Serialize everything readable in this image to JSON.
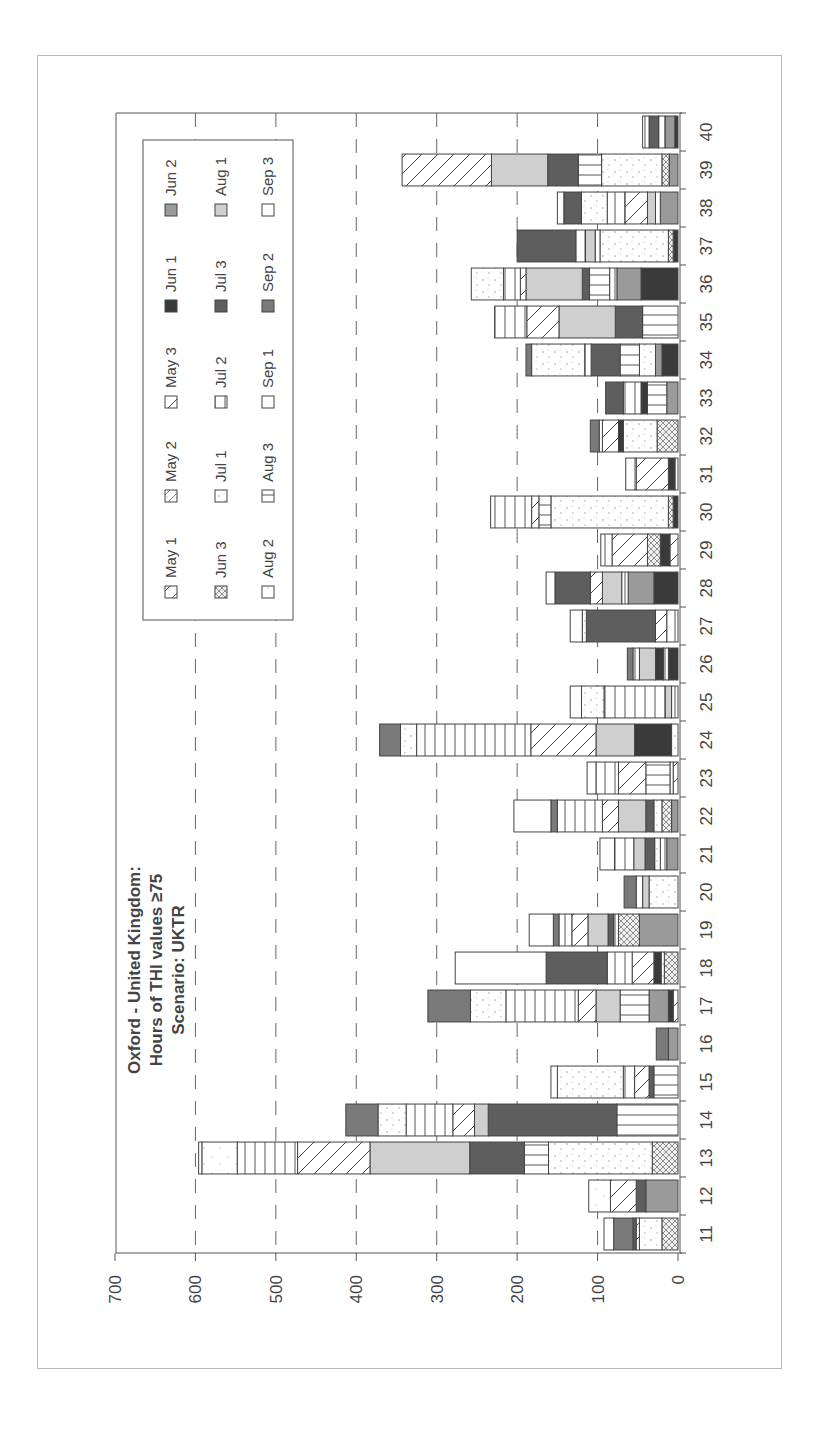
{
  "chart_data": {
    "type": "bar",
    "stacked": true,
    "orientation": "rotated-90",
    "title": "Oxford - United Kingdom:",
    "subtitle": "Hours of THI values ≥ 75",
    "scenario": "Scenario: UKTR",
    "title_lines": [
      "Oxford - United Kingdom:",
      "Hours of THI values ≥75",
      "Scenario: UKTR"
    ],
    "xlabel": "",
    "ylabel": "",
    "ylim": [
      0,
      700
    ],
    "yticks": [
      "0",
      "100",
      "200",
      "300",
      "400",
      "500",
      "600",
      "700"
    ],
    "grid": "dashed-major",
    "legend_position": "inside-top",
    "categories": [
      "11",
      "12",
      "13",
      "14",
      "15",
      "16",
      "17",
      "18",
      "19",
      "20",
      "21",
      "22",
      "23",
      "24",
      "25",
      "26",
      "27",
      "28",
      "29",
      "30",
      "31",
      "32",
      "33",
      "34",
      "35",
      "36",
      "37",
      "38",
      "39",
      "40"
    ],
    "legend": [
      {
        "key": "may1",
        "label": "May 1",
        "pattern": "diag-sparse"
      },
      {
        "key": "may2",
        "label": "May 2",
        "pattern": "diag-dot"
      },
      {
        "key": "may3",
        "label": "May 3",
        "pattern": "diag-dense"
      },
      {
        "key": "jun1",
        "label": "Jun 1",
        "pattern": "solid-darkest"
      },
      {
        "key": "jun2",
        "label": "Jun 2",
        "pattern": "solid-mid"
      },
      {
        "key": "jun3",
        "label": "Jun 3",
        "pattern": "crosshatch"
      },
      {
        "key": "jul1",
        "label": "Jul 1",
        "pattern": "dots"
      },
      {
        "key": "jul2",
        "label": "Jul 2",
        "pattern": "vertical"
      },
      {
        "key": "jul3",
        "label": "Jul 3",
        "pattern": "solid-dark"
      },
      {
        "key": "aug1",
        "label": "Aug 1",
        "pattern": "solid-light"
      },
      {
        "key": "aug2",
        "label": "Aug 2",
        "pattern": "dots-sparse"
      },
      {
        "key": "aug3",
        "label": "Aug 3",
        "pattern": "horizontal"
      },
      {
        "key": "sep1",
        "label": "Sep 1",
        "pattern": "white"
      },
      {
        "key": "sep2",
        "label": "Sep 2",
        "pattern": "solid-gray"
      },
      {
        "key": "sep3",
        "label": "Sep 3",
        "pattern": "white"
      }
    ],
    "totals": [
      92,
      111,
      596,
      413,
      158,
      27,
      311,
      277,
      185,
      67,
      97,
      204,
      113,
      371,
      134,
      63,
      134,
      164,
      96,
      233,
      65,
      109,
      90,
      189,
      228,
      257,
      200,
      150,
      343,
      44
    ],
    "bars": [
      {
        "week": "11",
        "segments": [
          [
            "jun3",
            20
          ],
          [
            "jul1",
            28
          ],
          [
            "may1",
            4
          ],
          [
            "jul3",
            4
          ],
          [
            "sep2",
            24
          ],
          [
            "sep3",
            12
          ]
        ]
      },
      {
        "week": "12",
        "segments": [
          [
            "jun2",
            40
          ],
          [
            "jul3",
            12
          ],
          [
            "may3",
            32
          ],
          [
            "aug2",
            27
          ]
        ]
      },
      {
        "week": "13",
        "segments": [
          [
            "jun3",
            32
          ],
          [
            "jul1",
            129
          ],
          [
            "aug3",
            30
          ],
          [
            "jul3",
            68
          ],
          [
            "aug1",
            124
          ],
          [
            "may3",
            90
          ],
          [
            "jul2",
            75
          ],
          [
            "aug2",
            44
          ],
          [
            "jul2",
            4
          ]
        ]
      },
      {
        "week": "14",
        "segments": [
          [
            "aug3",
            76
          ],
          [
            "jul3",
            160
          ],
          [
            "aug1",
            17
          ],
          [
            "may3",
            27
          ],
          [
            "jul2",
            58
          ],
          [
            "jul1",
            35
          ],
          [
            "sep2",
            40
          ]
        ]
      },
      {
        "week": "15",
        "segments": [
          [
            "aug3",
            30
          ],
          [
            "jul3",
            6
          ],
          [
            "may3",
            18
          ],
          [
            "jul2",
            14
          ],
          [
            "jul1",
            82
          ],
          [
            "sep3",
            8
          ]
        ]
      },
      {
        "week": "16",
        "segments": [
          [
            "jun2",
            12
          ],
          [
            "sep2",
            15
          ]
        ]
      },
      {
        "week": "17",
        "segments": [
          [
            "may3",
            6
          ],
          [
            "jun1",
            6
          ],
          [
            "jun2",
            24
          ],
          [
            "aug3",
            36
          ],
          [
            "aug1",
            30
          ],
          [
            "may3",
            22
          ],
          [
            "jul2",
            90
          ],
          [
            "jul1",
            44
          ],
          [
            "sep2",
            53
          ]
        ]
      },
      {
        "week": "18",
        "segments": [
          [
            "jun3",
            17
          ],
          [
            "jul1",
            4
          ],
          [
            "jun1",
            9
          ],
          [
            "may3",
            27
          ],
          [
            "jul2",
            31
          ],
          [
            "jul3",
            76
          ],
          [
            "sep3",
            113
          ]
        ]
      },
      {
        "week": "19",
        "segments": [
          [
            "jun2",
            48
          ],
          [
            "jun3",
            26
          ],
          [
            "jul2",
            6
          ],
          [
            "jul3",
            7
          ],
          [
            "aug1",
            25
          ],
          [
            "may3",
            20
          ],
          [
            "jul2",
            16
          ],
          [
            "sep2",
            7
          ],
          [
            "sep3",
            30
          ]
        ]
      },
      {
        "week": "20",
        "segments": [
          [
            "jul1",
            36
          ],
          [
            "aug1",
            8
          ],
          [
            "jul2",
            8
          ],
          [
            "sep2",
            15
          ]
        ]
      },
      {
        "week": "21",
        "segments": [
          [
            "jun2",
            14
          ],
          [
            "jul2",
            8
          ],
          [
            "jul1",
            7
          ],
          [
            "jul3",
            12
          ],
          [
            "aug1",
            14
          ],
          [
            "jul2",
            24
          ],
          [
            "sep3",
            18
          ]
        ]
      },
      {
        "week": "22",
        "segments": [
          [
            "jun2",
            8
          ],
          [
            "jun3",
            12
          ],
          [
            "jul1",
            10
          ],
          [
            "jul3",
            10
          ],
          [
            "aug1",
            34
          ],
          [
            "may3",
            20
          ],
          [
            "jul2",
            56
          ],
          [
            "sep2",
            8
          ],
          [
            "sep3",
            46
          ]
        ]
      },
      {
        "week": "23",
        "segments": [
          [
            "may3",
            6
          ],
          [
            "aug2",
            4
          ],
          [
            "aug3",
            30
          ],
          [
            "may3",
            34
          ],
          [
            "jul2",
            28
          ],
          [
            "sep3",
            11
          ]
        ]
      },
      {
        "week": "24",
        "segments": [
          [
            "jul1",
            8
          ],
          [
            "jun1",
            46
          ],
          [
            "aug1",
            48
          ],
          [
            "may3",
            81
          ],
          [
            "jul2",
            142
          ],
          [
            "jul1",
            20
          ],
          [
            "sep2",
            26
          ]
        ]
      },
      {
        "week": "25",
        "segments": [
          [
            "jul2",
            8
          ],
          [
            "aug1",
            8
          ],
          [
            "jul2",
            76
          ],
          [
            "jul1",
            28
          ],
          [
            "sep3",
            14
          ]
        ]
      },
      {
        "week": "26",
        "segments": [
          [
            "jun1",
            12
          ],
          [
            "jul2",
            6
          ],
          [
            "jun1",
            10
          ],
          [
            "aug1",
            20
          ],
          [
            "jul2",
            8
          ],
          [
            "sep2",
            7
          ]
        ]
      },
      {
        "week": "27",
        "segments": [
          [
            "jul2",
            14
          ],
          [
            "may3",
            14
          ],
          [
            "jul3",
            86
          ],
          [
            "jul1",
            5
          ],
          [
            "sep3",
            15
          ]
        ]
      },
      {
        "week": "28",
        "segments": [
          [
            "jun1",
            30
          ],
          [
            "jun2",
            32
          ],
          [
            "jul2",
            8
          ],
          [
            "aug1",
            24
          ],
          [
            "may3",
            15
          ],
          [
            "jul3",
            44
          ],
          [
            "sep3",
            11
          ]
        ]
      },
      {
        "week": "29",
        "segments": [
          [
            "may3",
            10
          ],
          [
            "jun1",
            12
          ],
          [
            "jun3",
            16
          ],
          [
            "may3",
            44
          ],
          [
            "jul2",
            14
          ]
        ]
      },
      {
        "week": "30",
        "segments": [
          [
            "jun1",
            6
          ],
          [
            "jun3",
            6
          ],
          [
            "jul1",
            146
          ],
          [
            "aug3",
            15
          ],
          [
            "may3",
            9
          ],
          [
            "jul2",
            51
          ]
        ]
      },
      {
        "week": "31",
        "segments": [
          [
            "jul2",
            4
          ],
          [
            "jun1",
            8
          ],
          [
            "may3",
            40
          ],
          [
            "jul2",
            13
          ]
        ]
      },
      {
        "week": "32",
        "segments": [
          [
            "jun3",
            26
          ],
          [
            "jul1",
            42
          ],
          [
            "jun1",
            6
          ],
          [
            "may3",
            20
          ],
          [
            "jul2",
            4
          ],
          [
            "sep2",
            11
          ]
        ]
      },
      {
        "week": "33",
        "segments": [
          [
            "jun2",
            14
          ],
          [
            "aug3",
            24
          ],
          [
            "jun1",
            8
          ],
          [
            "jul2",
            22
          ],
          [
            "jul3",
            22
          ]
        ]
      },
      {
        "week": "34",
        "segments": [
          [
            "jun1",
            20
          ],
          [
            "jun2",
            8
          ],
          [
            "jul1",
            20
          ],
          [
            "aug3",
            24
          ],
          [
            "jul3",
            36
          ],
          [
            "jul2",
            8
          ],
          [
            "jul1",
            66
          ],
          [
            "sep2",
            7
          ]
        ]
      },
      {
        "week": "35",
        "segments": [
          [
            "aug3",
            44
          ],
          [
            "jul3",
            34
          ],
          [
            "aug1",
            70
          ],
          [
            "may3",
            40
          ],
          [
            "jul2",
            40
          ]
        ]
      },
      {
        "week": "36",
        "segments": [
          [
            "jun1",
            46
          ],
          [
            "jun2",
            30
          ],
          [
            "jul2",
            9
          ],
          [
            "aug3",
            25
          ],
          [
            "jul3",
            9
          ],
          [
            "aug1",
            70
          ],
          [
            "may3",
            7
          ],
          [
            "jul2",
            21
          ],
          [
            "jul1",
            40
          ]
        ]
      },
      {
        "week": "37",
        "segments": [
          [
            "jun1",
            6
          ],
          [
            "jun3",
            6
          ],
          [
            "jul1",
            85
          ],
          [
            "jul2",
            6
          ],
          [
            "aug1",
            12
          ],
          [
            "jul2",
            12
          ],
          [
            "jul3",
            73
          ]
        ]
      },
      {
        "week": "38",
        "segments": [
          [
            "jun2",
            22
          ],
          [
            "jul2",
            6
          ],
          [
            "aug1",
            10
          ],
          [
            "may3",
            28
          ],
          [
            "jul2",
            22
          ],
          [
            "jul1",
            32
          ],
          [
            "jul3",
            22
          ],
          [
            "sep3",
            8
          ]
        ]
      },
      {
        "week": "39",
        "segments": [
          [
            "jun2",
            11
          ],
          [
            "jun3",
            9
          ],
          [
            "jul1",
            75
          ],
          [
            "aug3",
            29
          ],
          [
            "jul3",
            38
          ],
          [
            "aug1",
            70
          ],
          [
            "may3",
            111
          ]
        ]
      },
      {
        "week": "40",
        "segments": [
          [
            "jun1",
            4
          ],
          [
            "jun2",
            12
          ],
          [
            "jul2",
            8
          ],
          [
            "jul3",
            12
          ],
          [
            "jul2",
            8
          ]
        ]
      }
    ]
  }
}
